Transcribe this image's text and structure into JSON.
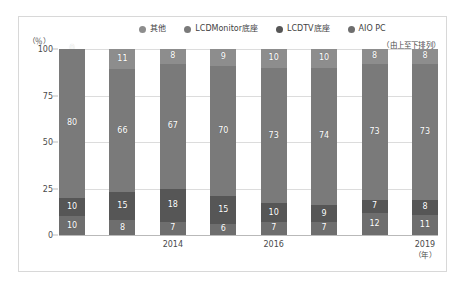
{
  "chart_data": {
    "type": "bar",
    "subtype": "stacked-percentage",
    "title": "",
    "xlabel": "（年）",
    "ylabel": "（％）",
    "ylim": [
      0,
      100
    ],
    "yticks": [
      "100",
      "75",
      "50",
      "25",
      "0"
    ],
    "grid": true,
    "legend_position": "top-center",
    "legend_note": "（由上至下排列）",
    "stack_order_note": "series listed top to bottom",
    "categories": [
      "2012",
      "2013",
      "2014",
      "2015",
      "2016",
      "2017",
      "2018",
      "2019"
    ],
    "xtick_labels": [
      "",
      "",
      "2014",
      "",
      "2016",
      "",
      "",
      "2019"
    ],
    "series": [
      {
        "name": "其他",
        "color": "#8d8d8d",
        "values": [
          0,
          11,
          8,
          9,
          10,
          10,
          8,
          8
        ]
      },
      {
        "name": "LCDMonitor底座",
        "color": "#7a7a7a",
        "values": [
          80,
          66,
          67,
          70,
          73,
          74,
          73,
          73
        ]
      },
      {
        "name": "LCDTV底座",
        "color": "#565656",
        "values": [
          10,
          15,
          18,
          15,
          10,
          9,
          7,
          8
        ]
      },
      {
        "name": "AIO PC",
        "color": "#6e6e6e",
        "values": [
          10,
          8,
          7,
          6,
          7,
          7,
          12,
          11
        ]
      }
    ]
  },
  "colors": {
    "card_border": "#d8d8d8",
    "gridline": "#dcdcdc",
    "axis": "#b9b9b9",
    "text": "#4a4a4a",
    "bar_label": "#ffffff"
  }
}
